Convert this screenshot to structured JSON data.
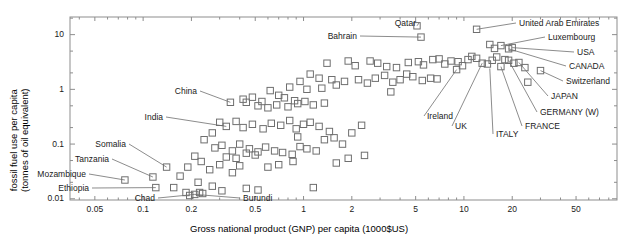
{
  "chart_data": {
    "type": "scatter",
    "title": "",
    "xlabel": "Gross national product (GNP) per capita (1000$US)",
    "ylabel_line1": "fossil fuel use per capita",
    "ylabel_line2": "(tonnes of oil equivalent)",
    "xscale": "log",
    "yscale": "log",
    "xlim": [
      0.035,
      90
    ],
    "ylim": [
      0.0095,
      21
    ],
    "grid": false,
    "legend": "none",
    "xticks": [
      0.05,
      0.1,
      0.2,
      0.5,
      1,
      2,
      5,
      10,
      20,
      50
    ],
    "xticklabels": [
      "0.05",
      "0.1",
      "0.2",
      "0.5",
      "1",
      "2",
      "5",
      "10",
      "20",
      "50"
    ],
    "yticks": [
      0.01,
      0.1,
      1,
      10
    ],
    "yticklabels": [
      "0.01",
      "0.1",
      "1",
      "10"
    ],
    "marker": "open square",
    "marker_color": "#6f6f6f",
    "annotations": [
      {
        "label": "Qatar",
        "x": 5.1,
        "y": 14.5,
        "lx": 416,
        "ly": 19,
        "anchor": "right"
      },
      {
        "label": "United Arab Emirates",
        "x": 12.0,
        "y": 12.5,
        "lx": 519,
        "ly": 19,
        "anchor": "left"
      },
      {
        "label": "Bahrain",
        "x": 5.4,
        "y": 9.0,
        "lx": 357,
        "ly": 32,
        "anchor": "right"
      },
      {
        "label": "Luxembourg",
        "x": 17.0,
        "y": 6.3,
        "lx": 548,
        "ly": 33,
        "anchor": "left"
      },
      {
        "label": "USA",
        "x": 20.0,
        "y": 5.8,
        "lx": 577,
        "ly": 48,
        "anchor": "left"
      },
      {
        "label": "CANADA",
        "x": 19.0,
        "y": 5.5,
        "lx": 569,
        "ly": 62,
        "anchor": "left"
      },
      {
        "label": "Switzerland",
        "x": 30.0,
        "y": 2.2,
        "lx": 566,
        "ly": 77,
        "anchor": "left"
      },
      {
        "label": "JAPAN",
        "x": 22.0,
        "y": 3.1,
        "lx": 551,
        "ly": 92,
        "anchor": "left"
      },
      {
        "label": "GERMANY  (W)",
        "x": 19.0,
        "y": 3.4,
        "lx": 540,
        "ly": 108,
        "anchor": "left"
      },
      {
        "label": "FRANCE",
        "x": 17.0,
        "y": 2.6,
        "lx": 525,
        "ly": 122,
        "anchor": "left"
      },
      {
        "label": "ITALY",
        "x": 14.5,
        "y": 2.4,
        "lx": 496,
        "ly": 130,
        "anchor": "left"
      },
      {
        "label": "UK",
        "x": 13.0,
        "y": 3.0,
        "lx": 455,
        "ly": 122,
        "anchor": "left"
      },
      {
        "label": "Ireland",
        "x": 9.0,
        "y": 2.3,
        "lx": 427,
        "ly": 112,
        "anchor": "left"
      },
      {
        "label": "China",
        "x": 0.35,
        "y": 0.58,
        "lx": 197,
        "ly": 87,
        "anchor": "right"
      },
      {
        "label": "India",
        "x": 0.33,
        "y": 0.21,
        "lx": 163,
        "ly": 113,
        "anchor": "right"
      },
      {
        "label": "Somalia",
        "x": 0.14,
        "y": 0.038,
        "lx": 126,
        "ly": 140,
        "anchor": "right"
      },
      {
        "label": "Tanzania",
        "x": 0.115,
        "y": 0.025,
        "lx": 109,
        "ly": 155,
        "anchor": "right"
      },
      {
        "label": "Mozambique",
        "x": 0.077,
        "y": 0.022,
        "lx": 86,
        "ly": 170,
        "anchor": "right"
      },
      {
        "label": "Ethiopia",
        "x": 0.12,
        "y": 0.016,
        "lx": 89,
        "ly": 184,
        "anchor": "right"
      },
      {
        "label": "Chad",
        "x": 0.21,
        "y": 0.012,
        "lx": 155,
        "ly": 194,
        "anchor": "right"
      },
      {
        "label": "Burundi",
        "x": 0.21,
        "y": 0.012,
        "lx": 243,
        "ly": 194,
        "anchor": "left"
      }
    ],
    "points": [
      {
        "x": 5.1,
        "y": 14.5
      },
      {
        "x": 12.0,
        "y": 12.5
      },
      {
        "x": 5.4,
        "y": 9.0
      },
      {
        "x": 14.5,
        "y": 6.6
      },
      {
        "x": 17.0,
        "y": 6.3
      },
      {
        "x": 15.5,
        "y": 5.6
      },
      {
        "x": 20.0,
        "y": 5.8
      },
      {
        "x": 19.0,
        "y": 5.5
      },
      {
        "x": 1.4,
        "y": 3.0
      },
      {
        "x": 1.9,
        "y": 3.3
      },
      {
        "x": 2.1,
        "y": 2.7
      },
      {
        "x": 2.6,
        "y": 3.3
      },
      {
        "x": 2.9,
        "y": 3.0
      },
      {
        "x": 3.3,
        "y": 2.6
      },
      {
        "x": 3.8,
        "y": 2.5
      },
      {
        "x": 4.5,
        "y": 3.1
      },
      {
        "x": 5.2,
        "y": 3.2
      },
      {
        "x": 5.6,
        "y": 2.8
      },
      {
        "x": 6.4,
        "y": 3.5
      },
      {
        "x": 7.0,
        "y": 3.6
      },
      {
        "x": 7.6,
        "y": 2.9
      },
      {
        "x": 8.3,
        "y": 3.3
      },
      {
        "x": 9.2,
        "y": 3.2
      },
      {
        "x": 9.8,
        "y": 2.7
      },
      {
        "x": 10.6,
        "y": 3.5
      },
      {
        "x": 11.2,
        "y": 4.0
      },
      {
        "x": 12.0,
        "y": 3.7
      },
      {
        "x": 13.0,
        "y": 3.0
      },
      {
        "x": 14.0,
        "y": 2.9
      },
      {
        "x": 15.0,
        "y": 3.4
      },
      {
        "x": 16.0,
        "y": 3.9
      },
      {
        "x": 17.0,
        "y": 2.6
      },
      {
        "x": 18.0,
        "y": 3.5
      },
      {
        "x": 19.0,
        "y": 3.4
      },
      {
        "x": 20.5,
        "y": 3.0
      },
      {
        "x": 22.0,
        "y": 3.1
      },
      {
        "x": 24.0,
        "y": 2.5
      },
      {
        "x": 30.0,
        "y": 2.2
      },
      {
        "x": 9.0,
        "y": 2.3
      },
      {
        "x": 1.1,
        "y": 1.9
      },
      {
        "x": 1.25,
        "y": 1.6
      },
      {
        "x": 1.5,
        "y": 1.5
      },
      {
        "x": 0.95,
        "y": 1.4
      },
      {
        "x": 0.82,
        "y": 1.1
      },
      {
        "x": 1.05,
        "y": 1.0
      },
      {
        "x": 1.3,
        "y": 1.05
      },
      {
        "x": 1.6,
        "y": 1.2
      },
      {
        "x": 1.8,
        "y": 1.4
      },
      {
        "x": 2.2,
        "y": 1.5
      },
      {
        "x": 2.5,
        "y": 1.3
      },
      {
        "x": 2.8,
        "y": 1.6
      },
      {
        "x": 3.2,
        "y": 1.8
      },
      {
        "x": 3.6,
        "y": 1.35
      },
      {
        "x": 4.0,
        "y": 1.5
      },
      {
        "x": 4.4,
        "y": 1.9
      },
      {
        "x": 4.8,
        "y": 1.7
      },
      {
        "x": 5.5,
        "y": 1.45
      },
      {
        "x": 6.2,
        "y": 1.6
      },
      {
        "x": 6.8,
        "y": 1.55
      },
      {
        "x": 0.62,
        "y": 0.95
      },
      {
        "x": 0.7,
        "y": 0.78
      },
      {
        "x": 0.76,
        "y": 0.7
      },
      {
        "x": 0.88,
        "y": 0.62
      },
      {
        "x": 0.55,
        "y": 0.6
      },
      {
        "x": 0.48,
        "y": 0.72
      },
      {
        "x": 0.42,
        "y": 0.66
      },
      {
        "x": 0.35,
        "y": 0.58
      },
      {
        "x": 0.44,
        "y": 0.58
      },
      {
        "x": 0.52,
        "y": 0.5
      },
      {
        "x": 0.6,
        "y": 0.46
      },
      {
        "x": 0.68,
        "y": 0.52
      },
      {
        "x": 0.8,
        "y": 0.48
      },
      {
        "x": 0.92,
        "y": 0.55
      },
      {
        "x": 1.02,
        "y": 0.6
      },
      {
        "x": 1.15,
        "y": 0.52
      },
      {
        "x": 1.35,
        "y": 0.56
      },
      {
        "x": 0.33,
        "y": 0.21
      },
      {
        "x": 0.38,
        "y": 0.26
      },
      {
        "x": 0.3,
        "y": 0.25
      },
      {
        "x": 0.27,
        "y": 0.16
      },
      {
        "x": 0.42,
        "y": 0.2
      },
      {
        "x": 0.48,
        "y": 0.23
      },
      {
        "x": 0.56,
        "y": 0.19
      },
      {
        "x": 0.63,
        "y": 0.24
      },
      {
        "x": 0.72,
        "y": 0.22
      },
      {
        "x": 0.82,
        "y": 0.27
      },
      {
        "x": 0.9,
        "y": 0.19
      },
      {
        "x": 1.0,
        "y": 0.23
      },
      {
        "x": 1.1,
        "y": 0.25
      },
      {
        "x": 1.25,
        "y": 0.21
      },
      {
        "x": 1.45,
        "y": 0.17
      },
      {
        "x": 0.24,
        "y": 0.12
      },
      {
        "x": 0.28,
        "y": 0.085
      },
      {
        "x": 0.31,
        "y": 0.095
      },
      {
        "x": 0.36,
        "y": 0.075
      },
      {
        "x": 0.4,
        "y": 0.1
      },
      {
        "x": 0.46,
        "y": 0.082
      },
      {
        "x": 0.52,
        "y": 0.072
      },
      {
        "x": 0.58,
        "y": 0.088
      },
      {
        "x": 0.44,
        "y": 0.068
      },
      {
        "x": 0.5,
        "y": 0.063
      },
      {
        "x": 0.38,
        "y": 0.055
      },
      {
        "x": 0.33,
        "y": 0.058
      },
      {
        "x": 0.66,
        "y": 0.075
      },
      {
        "x": 0.74,
        "y": 0.07
      },
      {
        "x": 0.85,
        "y": 0.065
      },
      {
        "x": 0.95,
        "y": 0.09
      },
      {
        "x": 1.05,
        "y": 0.082
      },
      {
        "x": 0.21,
        "y": 0.06
      },
      {
        "x": 0.23,
        "y": 0.048
      },
      {
        "x": 0.19,
        "y": 0.038
      },
      {
        "x": 0.26,
        "y": 0.034
      },
      {
        "x": 0.3,
        "y": 0.042
      },
      {
        "x": 0.36,
        "y": 0.03
      },
      {
        "x": 0.14,
        "y": 0.038
      },
      {
        "x": 0.17,
        "y": 0.026
      },
      {
        "x": 0.115,
        "y": 0.025
      },
      {
        "x": 0.077,
        "y": 0.022
      },
      {
        "x": 0.12,
        "y": 0.016
      },
      {
        "x": 0.155,
        "y": 0.016
      },
      {
        "x": 0.185,
        "y": 0.013
      },
      {
        "x": 0.21,
        "y": 0.012
      },
      {
        "x": 0.225,
        "y": 0.013
      },
      {
        "x": 0.235,
        "y": 0.0125
      },
      {
        "x": 0.195,
        "y": 0.0115
      },
      {
        "x": 0.27,
        "y": 0.017
      },
      {
        "x": 0.31,
        "y": 0.014
      },
      {
        "x": 0.22,
        "y": 0.02
      },
      {
        "x": 0.44,
        "y": 0.0155
      },
      {
        "x": 0.52,
        "y": 0.0145
      },
      {
        "x": 0.4,
        "y": 0.04
      },
      {
        "x": 0.6,
        "y": 0.038
      },
      {
        "x": 0.7,
        "y": 0.042
      },
      {
        "x": 0.86,
        "y": 0.048
      },
      {
        "x": 1.2,
        "y": 0.075
      },
      {
        "x": 1.35,
        "y": 0.12
      },
      {
        "x": 1.55,
        "y": 0.13
      },
      {
        "x": 1.75,
        "y": 0.1
      },
      {
        "x": 2.0,
        "y": 0.16
      },
      {
        "x": 2.3,
        "y": 0.22
      },
      {
        "x": 0.92,
        "y": 0.135
      },
      {
        "x": 1.6,
        "y": 0.045
      },
      {
        "x": 1.9,
        "y": 0.055
      },
      {
        "x": 2.4,
        "y": 0.062
      },
      {
        "x": 1.15,
        "y": 0.016
      },
      {
        "x": 3.5,
        "y": 0.9
      },
      {
        "x": 25.0,
        "y": 1.35
      }
    ]
  }
}
